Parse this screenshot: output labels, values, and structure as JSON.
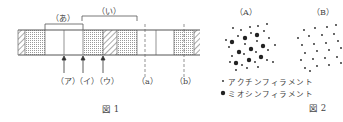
{
  "figure1": {
    "caption": "図 1",
    "bracket_labels": {
      "a": "（あ）",
      "i": "（い）"
    },
    "arrow_labels": [
      "（ア）",
      "（イ）",
      "（ウ）"
    ],
    "dashed_labels": [
      "（a）",
      "（b）"
    ],
    "segments": [
      {
        "x0": 18,
        "x1": 25,
        "pattern": "hatch"
      },
      {
        "x0": 25,
        "x1": 45,
        "pattern": "dots"
      },
      {
        "x0": 45,
        "x1": 64,
        "pattern": "white"
      },
      {
        "x0": 64,
        "x1": 83,
        "pattern": "white"
      },
      {
        "x0": 83,
        "x1": 103,
        "pattern": "dots"
      },
      {
        "x0": 103,
        "x1": 117,
        "pattern": "hatch"
      },
      {
        "x0": 117,
        "x1": 137,
        "pattern": "dots"
      },
      {
        "x0": 137,
        "x1": 156,
        "pattern": "white"
      },
      {
        "x0": 156,
        "x1": 174,
        "pattern": "white"
      },
      {
        "x0": 174,
        "x1": 194,
        "pattern": "dots"
      },
      {
        "x0": 194,
        "x1": 200,
        "pattern": "hatch"
      }
    ]
  },
  "figure2": {
    "caption": "図 2",
    "panel_labels": [
      "（A）",
      "（B）"
    ],
    "legend": [
      {
        "symbol": "small-dot",
        "label": "アクチンフィラメント"
      },
      {
        "symbol": "large-dot",
        "label": "ミオシンフィラメント"
      }
    ]
  }
}
